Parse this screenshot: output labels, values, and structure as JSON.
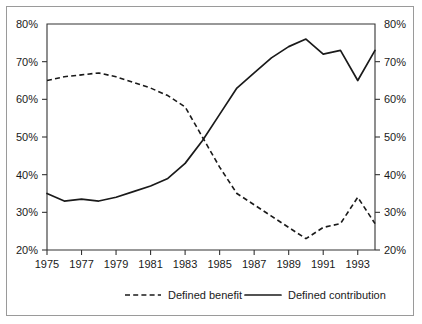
{
  "chart_data": {
    "type": "line",
    "title": "",
    "xlabel": "",
    "ylabel": "",
    "xlim": [
      1975,
      1994
    ],
    "ylim": [
      20,
      80
    ],
    "grid": false,
    "legend_position": "bottom",
    "y_tick_labels": [
      "80%",
      "70%",
      "60%",
      "50%",
      "40%",
      "30%",
      "20%"
    ],
    "y_ticks": [
      80,
      70,
      60,
      50,
      40,
      30,
      20
    ],
    "y_axis_right_labels": [
      "80%",
      "70%",
      "60%",
      "50%",
      "40%",
      "30%",
      "20%"
    ],
    "x_tick_labels": [
      "1975",
      "1977",
      "1979",
      "1981",
      "1983",
      "1985",
      "1987",
      "1989",
      "1991",
      "1993"
    ],
    "x_ticks": [
      1975,
      1977,
      1979,
      1981,
      1983,
      1985,
      1987,
      1989,
      1991,
      1993
    ],
    "x": [
      1975,
      1976,
      1977,
      1978,
      1979,
      1980,
      1981,
      1982,
      1983,
      1984,
      1985,
      1986,
      1987,
      1988,
      1989,
      1990,
      1991,
      1992,
      1993,
      1994
    ],
    "series": [
      {
        "name": "Defined benefit",
        "style": "dashed",
        "color": "#1a1a1a",
        "values": [
          65,
          66,
          66.5,
          67,
          66,
          64.5,
          63,
          61,
          58,
          50,
          42,
          35,
          32,
          29,
          26,
          23,
          26,
          27,
          34,
          27
        ]
      },
      {
        "name": "Defined contribution",
        "style": "solid",
        "color": "#1a1a1a",
        "values": [
          35,
          33,
          33.5,
          33,
          34,
          35.5,
          37,
          39,
          43,
          49,
          56,
          63,
          67,
          71,
          74,
          76,
          72,
          73,
          65,
          73
        ]
      }
    ],
    "legend": [
      {
        "label": "Defined benefit",
        "style": "dashed"
      },
      {
        "label": "Defined contribution",
        "style": "solid"
      }
    ]
  }
}
